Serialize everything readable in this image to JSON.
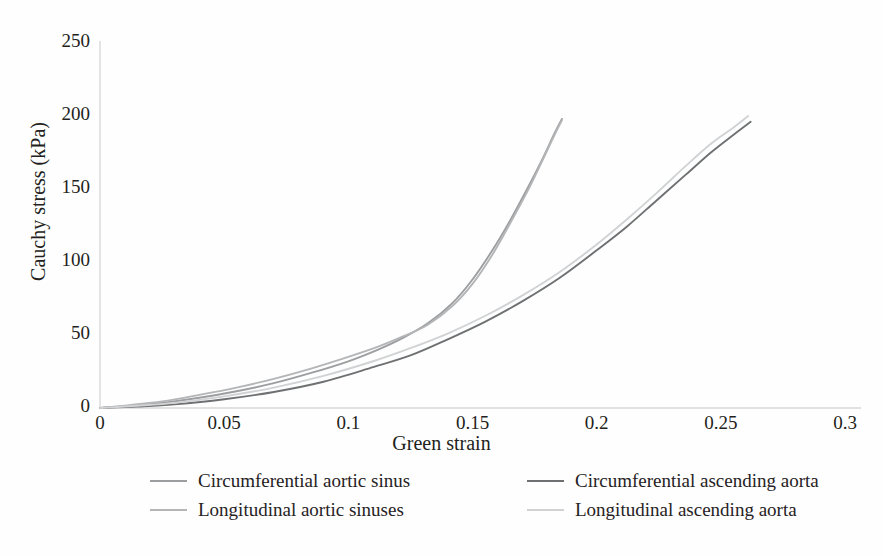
{
  "chart_data": {
    "type": "line",
    "title": "",
    "xlabel": "Green strain",
    "ylabel": "Cauchy stress (kPa)",
    "xlim": [
      0,
      0.3
    ],
    "ylim": [
      0,
      250
    ],
    "xticks": [
      "0",
      "0.05",
      "0.1",
      "0.15",
      "0.2",
      "0.25",
      "0.3"
    ],
    "yticks": [
      "0",
      "50",
      "100",
      "150",
      "200",
      "250"
    ],
    "xtick_values": [
      0,
      0.05,
      0.1,
      0.15,
      0.2,
      0.25,
      0.3
    ],
    "ytick_values": [
      0,
      50,
      100,
      150,
      200,
      250
    ],
    "grid": false,
    "legend_position": "bottom",
    "series": [
      {
        "name": "Circumferential aortic sinus",
        "color": "#9c9ea0",
        "x": [
          0,
          0.012,
          0.025,
          0.04,
          0.055,
          0.07,
          0.085,
          0.1,
          0.112,
          0.122,
          0.132,
          0.142,
          0.15,
          0.158,
          0.165,
          0.172,
          0.178,
          0.183,
          0.186
        ],
        "y": [
          0,
          1.5,
          3.5,
          7,
          11.5,
          17,
          24,
          32,
          40,
          48,
          58,
          72,
          88,
          108,
          128,
          150,
          170,
          188,
          198
        ]
      },
      {
        "name": "Longitudinal aortic sinuses",
        "color": "#b3b5b7",
        "x": [
          0,
          0.012,
          0.025,
          0.04,
          0.055,
          0.07,
          0.085,
          0.1,
          0.112,
          0.122,
          0.132,
          0.142,
          0.15,
          0.158,
          0.165,
          0.172,
          0.178,
          0.183,
          0.186
        ],
        "y": [
          0,
          2,
          4.5,
          9,
          14,
          20,
          27,
          35,
          42,
          49,
          57,
          70,
          85,
          105,
          126,
          148,
          169,
          187,
          197
        ]
      },
      {
        "name": "Circumferential ascending aorta",
        "color": "#6e7072",
        "x": [
          0,
          0.015,
          0.03,
          0.05,
          0.07,
          0.09,
          0.11,
          0.125,
          0.14,
          0.155,
          0.17,
          0.185,
          0.2,
          0.212,
          0.224,
          0.236,
          0.246,
          0.255,
          0.262
        ],
        "y": [
          0,
          1,
          2.5,
          6,
          11,
          18,
          28,
          36,
          47,
          59,
          73,
          89,
          108,
          124,
          142,
          160,
          175,
          187,
          196
        ]
      },
      {
        "name": "Longitudinal ascending aorta",
        "color": "#d0d2d4",
        "x": [
          0,
          0.015,
          0.03,
          0.05,
          0.07,
          0.09,
          0.11,
          0.125,
          0.14,
          0.155,
          0.17,
          0.185,
          0.2,
          0.212,
          0.224,
          0.236,
          0.246,
          0.255,
          0.261
        ],
        "y": [
          0,
          1.5,
          3.5,
          8,
          14,
          22,
          32,
          41,
          51,
          63,
          77,
          93,
          112,
          129,
          147,
          166,
          181,
          192,
          200
        ]
      }
    ]
  },
  "axis": {
    "axis_line_color": "#d9d9d9",
    "x_axis_label": "Green strain",
    "y_axis_label": "Cauchy stress (kPa)"
  }
}
